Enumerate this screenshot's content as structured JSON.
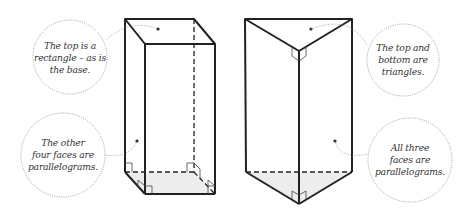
{
  "diagram": {
    "colors": {
      "edge": "#222222",
      "base_fill": "#ededed",
      "callout_ring": "#888888",
      "text": "#333333"
    },
    "figures": [
      {
        "name": "rectangular-prism",
        "callouts": [
          {
            "id": "rect-top",
            "text": "The top is a\nrectangle – as is\nthe base."
          },
          {
            "id": "rect-faces",
            "text": "The other\nfour faces are\nparallelograms."
          }
        ]
      },
      {
        "name": "triangular-prism",
        "callouts": [
          {
            "id": "tri-top",
            "text": "The top and\nbottom are\ntriangles."
          },
          {
            "id": "tri-faces",
            "text": "All three\nfaces are\nparallelograms."
          }
        ]
      }
    ]
  }
}
